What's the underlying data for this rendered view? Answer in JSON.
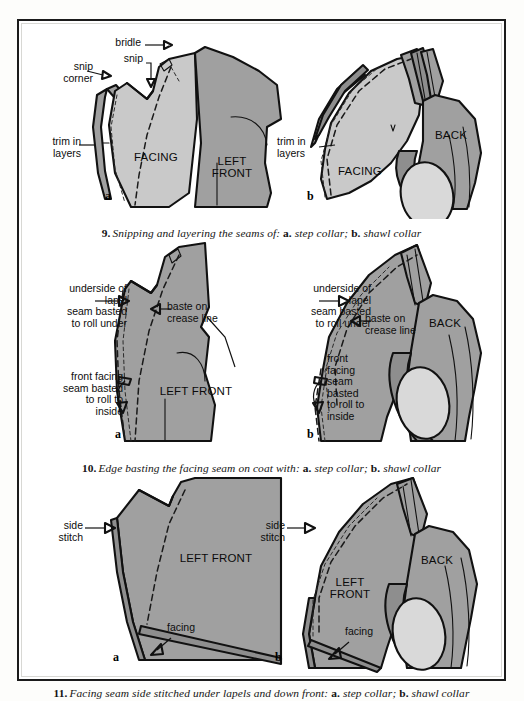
{
  "page": {
    "kind": "tailoring-instruction-plate",
    "background_color": "#fdfdfb",
    "frame_color": "#1b1b1b",
    "fabric_light": "#c9c9c9",
    "fabric_mid": "#a0a0a0",
    "fabric_dark": "#8e8e8e",
    "fabric_pale": "#d9d9d9"
  },
  "figures": [
    {
      "number": "9.",
      "caption_text": "Snipping and layering the seams of:",
      "caption_a_key": "a.",
      "caption_a_value": "step collar;",
      "caption_b_key": "b.",
      "caption_b_value": "shawl collar",
      "sub_a": "a",
      "sub_b": "b",
      "labels": {
        "bridle": "bridle",
        "snip": "snip",
        "snip_corner": "snip\ncorner",
        "trim_in_layers_a": "trim in\nlayers",
        "trim_in_layers_b": "trim in\nlayers"
      },
      "parts": {
        "facing_a": "FACING",
        "left_front_a": "LEFT\nFRONT",
        "facing_b": "FACING",
        "back_b": "BACK"
      }
    },
    {
      "number": "10.",
      "caption_text": "Edge basting the facing seam on coat with:",
      "caption_a_key": "a.",
      "caption_a_value": "step collar;",
      "caption_b_key": "b.",
      "caption_b_value": "shawl collar",
      "sub_a": "a",
      "sub_b": "b",
      "labels": {
        "underside_a": "underside of\nlapel\nseam basted\nto roll under",
        "baste_crease_a": "baste on\ncrease line",
        "front_facing_a": "front facing\nseam basted\nto roll to\ninside",
        "underside_b": "underside of\nlapel\nseam basted\nto roll under",
        "baste_crease_b": "baste on\ncrease line",
        "front_facing_b": "front\nfacing\nseam\nbasted\nto roll to\ninside"
      },
      "parts": {
        "left_front_a": "LEFT FRONT",
        "back_b": "BACK"
      }
    },
    {
      "number": "11.",
      "caption_text": "Facing seam side stitched under lapels and down front:",
      "caption_a_key": "a.",
      "caption_a_value": "step collar;",
      "caption_b_key": "b.",
      "caption_b_value": "shawl collar",
      "sub_a": "a",
      "sub_b": "b",
      "labels": {
        "side_stitch_a": "side\nstitch",
        "facing_a": "facing",
        "side_stitch_b": "side\nstitch",
        "facing_b": "facing"
      },
      "parts": {
        "left_front_a": "LEFT FRONT",
        "left_front_b": "LEFT\nFRONT",
        "back_b": "BACK"
      }
    }
  ]
}
